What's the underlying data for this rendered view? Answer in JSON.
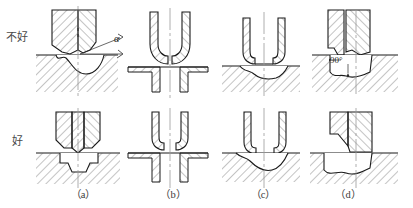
{
  "diagram": {
    "row_labels": {
      "bad": "不好",
      "good": "好"
    },
    "captions": [
      {
        "key": "a",
        "label": "（a）"
      },
      {
        "key": "b",
        "label": "（b）"
      },
      {
        "key": "c",
        "label": "（c）"
      },
      {
        "key": "d",
        "label": "（d）"
      }
    ],
    "annotations": {
      "alpha": "α",
      "right_angle": "90°"
    },
    "colors": {
      "outline": "#1a1a1a",
      "hatch": "#555555",
      "centerline": "#8a8a8a",
      "text": "#3c3c3c",
      "background": "#ffffff"
    },
    "columns": [
      {
        "key": "a",
        "bad_description": "Pointed punch tip with shallow angled contact on workpiece, angle alpha shown",
        "good_description": "Pointed punch tip seated flush in matching stepped recess"
      },
      {
        "key": "b",
        "bad_description": "Rounded punch nose with rounded hole entry, tangent contact",
        "good_description": "Rounded punch nose entering flat-bottom counterbored hole"
      },
      {
        "key": "c",
        "bad_description": "Flat punch face on uneven curved workpiece surface",
        "good_description": "Flat punch face on wavy workpiece surface with recess"
      },
      {
        "key": "d",
        "bad_description": "Stepped punch on sloped face with 90 degree corner callout",
        "good_description": "Stepped punch bearing on inclined machined seat"
      }
    ]
  }
}
